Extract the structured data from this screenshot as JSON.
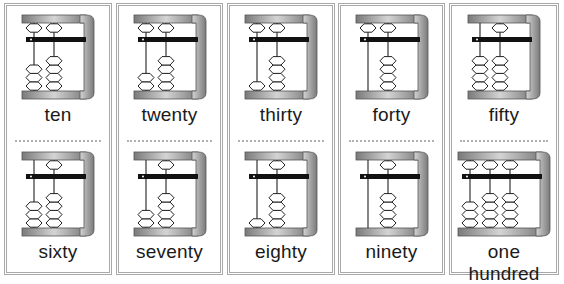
{
  "cards": [
    {
      "top": {
        "label": "ten",
        "rods": [
          {
            "upper": 1,
            "lower": 3
          },
          {
            "upper": 1,
            "lower": 4
          }
        ]
      },
      "bottom": {
        "label": "sixty",
        "rods": [
          {
            "upper": 0,
            "lower": 3
          },
          {
            "upper": 1,
            "lower": 4
          }
        ]
      }
    },
    {
      "top": {
        "label": "twenty",
        "rods": [
          {
            "upper": 1,
            "lower": 2
          },
          {
            "upper": 1,
            "lower": 4
          }
        ]
      },
      "bottom": {
        "label": "seventy",
        "rods": [
          {
            "upper": 0,
            "lower": 2
          },
          {
            "upper": 1,
            "lower": 4
          }
        ]
      }
    },
    {
      "top": {
        "label": "thirty",
        "rods": [
          {
            "upper": 1,
            "lower": 1
          },
          {
            "upper": 1,
            "lower": 4
          }
        ]
      },
      "bottom": {
        "label": "eighty",
        "rods": [
          {
            "upper": 0,
            "lower": 1
          },
          {
            "upper": 1,
            "lower": 4
          }
        ]
      }
    },
    {
      "top": {
        "label": "forty",
        "rods": [
          {
            "upper": 1,
            "lower": 0
          },
          {
            "upper": 1,
            "lower": 4
          }
        ]
      },
      "bottom": {
        "label": "ninety",
        "rods": [
          {
            "upper": 0,
            "lower": 0
          },
          {
            "upper": 1,
            "lower": 4
          }
        ]
      }
    },
    {
      "top": {
        "label": "fifty",
        "rods": [
          {
            "upper": 0,
            "lower": 4
          },
          {
            "upper": 1,
            "lower": 4
          }
        ]
      },
      "bottom": {
        "label": "one hundred",
        "rods": [
          {
            "upper": 1,
            "lower": 3
          },
          {
            "upper": 1,
            "lower": 4
          },
          {
            "upper": 1,
            "lower": 4
          }
        ]
      }
    }
  ],
  "colors": {
    "frame_light": "#d4d4d4",
    "frame_dark": "#7a7a7a",
    "bar": "#111111",
    "bead_stroke": "#222222",
    "border": "#a8a8a8"
  }
}
